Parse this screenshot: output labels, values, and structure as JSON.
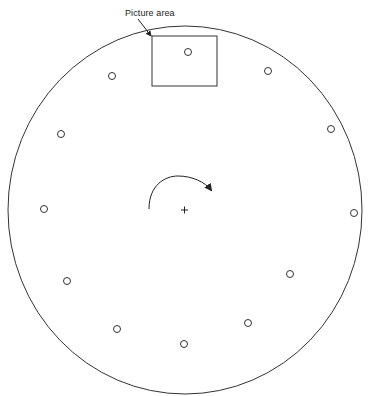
{
  "diagram": {
    "label": "Picture area",
    "outer_circle": {
      "cx": 185,
      "cy": 210,
      "rx": 177,
      "ry": 184
    },
    "picture_area": {
      "x": 152,
      "y": 36,
      "width": 65,
      "height": 50
    },
    "center_mark": "+",
    "rotation_direction": "clockwise",
    "holes": [
      {
        "cx": 188,
        "cy": 52
      },
      {
        "cx": 268,
        "cy": 71
      },
      {
        "cx": 331,
        "cy": 129
      },
      {
        "cx": 354,
        "cy": 213
      },
      {
        "cx": 290,
        "cy": 274
      },
      {
        "cx": 248,
        "cy": 323
      },
      {
        "cx": 184,
        "cy": 344
      },
      {
        "cx": 117,
        "cy": 329
      },
      {
        "cx": 67,
        "cy": 281
      },
      {
        "cx": 44,
        "cy": 209
      },
      {
        "cx": 61,
        "cy": 134
      },
      {
        "cx": 112,
        "cy": 76
      }
    ],
    "colors": {
      "stroke": "#333333",
      "background": "#ffffff"
    }
  }
}
